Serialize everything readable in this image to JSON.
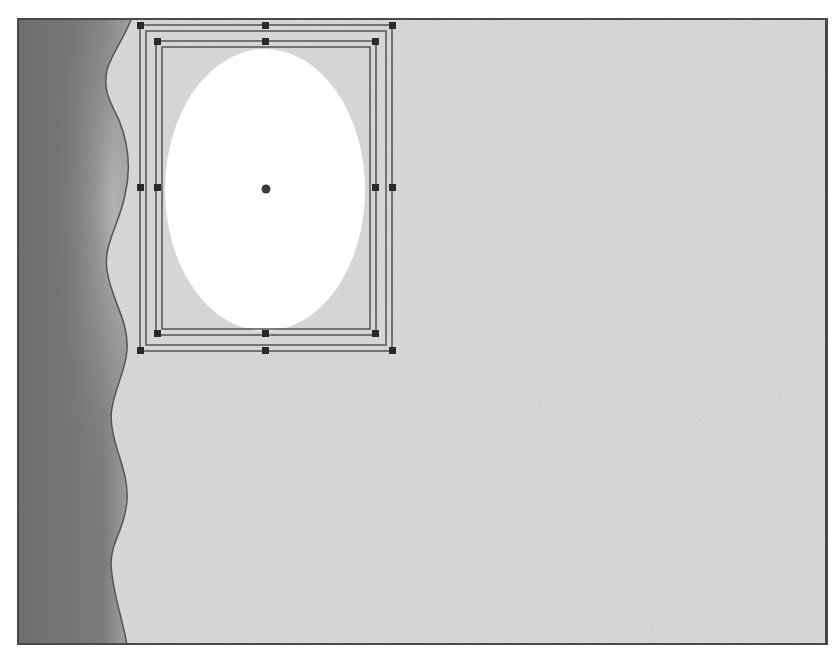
{
  "canvas": {
    "name": "drawing-canvas",
    "colors": {
      "background_texture": "#d9d9d9",
      "background_noise": "#bdbdbd",
      "band_dark": "#6e6e6e",
      "band_light": "#a8a8a8",
      "band_edge": "#555555",
      "ellipse_fill": "#ffffff",
      "frame_line": "#5a5a5a",
      "handle": "#2a2a2a",
      "border": "#4a4a4a"
    },
    "selected_object": {
      "type": "ellipse",
      "fill": "#ffffff",
      "selected": true,
      "selection_frames": 2,
      "handles_per_frame": 8,
      "center_marker": true
    },
    "left_band": {
      "type": "wavy-gradient-shape"
    }
  }
}
